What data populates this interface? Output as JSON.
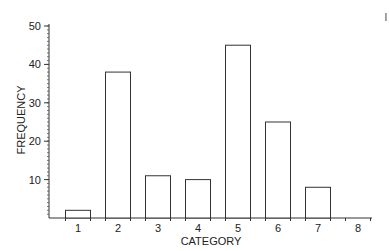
{
  "chart_data": {
    "type": "bar",
    "title": "",
    "xlabel": "CATEGORY",
    "ylabel": "FREQUENCY",
    "categories": [
      "1",
      "2",
      "3",
      "4",
      "5",
      "6",
      "7",
      "8"
    ],
    "values": [
      2,
      38,
      11,
      10,
      45,
      25,
      8,
      0
    ],
    "ylim": [
      0,
      50
    ],
    "yticks": [
      10,
      20,
      30,
      40,
      50
    ],
    "y_minor_tick_step": 1,
    "grid": false,
    "legend": null,
    "bar_fill": "#ffffff",
    "bar_stroke": "#333333"
  },
  "corner_mark": "I"
}
